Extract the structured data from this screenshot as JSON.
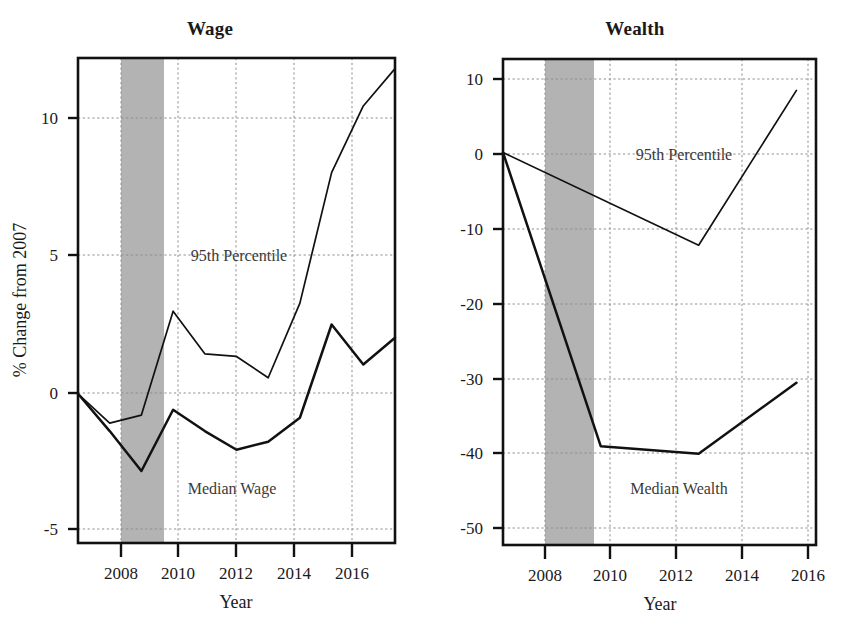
{
  "figure": {
    "background": "#ffffff",
    "ink_color": "#111111",
    "recession_band_color": "#a8a8a8",
    "gridline_color": "#8d8d8d"
  },
  "panels": [
    {
      "key": "wage",
      "title": "Wage",
      "xlabel": "Year",
      "ylabel": "% Change from 2007",
      "yticks": [
        "10",
        "5",
        "0",
        "-5"
      ],
      "xticks": [
        "2008",
        "2010",
        "2012",
        "2014",
        "2016"
      ],
      "annotations": [
        {
          "name": "p95-label",
          "text": "95th Percentile"
        },
        {
          "name": "median-label",
          "text": "Median Wage"
        }
      ]
    },
    {
      "key": "wealth",
      "title": "Wealth",
      "xlabel": "Year",
      "ylabel": "",
      "yticks": [
        "10",
        "0",
        "-10",
        "-20",
        "-30",
        "-40",
        "-50"
      ],
      "xticks": [
        "2008",
        "2010",
        "2012",
        "2014",
        "2016"
      ],
      "annotations": [
        {
          "name": "p95-label",
          "text": "95th Percentile"
        },
        {
          "name": "median-label",
          "text": "Median Wealth"
        }
      ]
    }
  ],
  "chart_data": [
    {
      "type": "line",
      "title": "Wage",
      "xlabel": "Year",
      "ylabel": "% Change from 2007",
      "xlim": [
        2007,
        2017
      ],
      "ylim": [
        -5.6,
        12.6
      ],
      "yticks": [
        10,
        5,
        0,
        -5
      ],
      "xticks": [
        2008,
        2010,
        2012,
        2014,
        2016
      ],
      "grid": true,
      "legend": "inline-annotation",
      "shaded_region": {
        "label": "Recession",
        "x_start": 2008.0,
        "x_end": 2009.5,
        "color": "#a8a8a8"
      },
      "series": [
        {
          "name": "95th Percentile",
          "x": [
            2007,
            2008,
            2009,
            2010,
            2011,
            2012,
            2013,
            2014,
            2015,
            2016,
            2017
          ],
          "values": [
            0.0,
            -1.1,
            -0.8,
            3.1,
            1.5,
            1.4,
            0.6,
            3.4,
            8.3,
            10.8,
            12.2
          ]
        },
        {
          "name": "Median Wage",
          "x": [
            2007,
            2008,
            2009,
            2010,
            2011,
            2012,
            2013,
            2014,
            2015,
            2016,
            2017
          ],
          "values": [
            0.0,
            -1.4,
            -2.9,
            -0.6,
            -1.4,
            -2.1,
            -1.8,
            -0.9,
            2.6,
            1.1,
            2.1
          ]
        }
      ]
    },
    {
      "type": "line",
      "title": "Wealth",
      "xlabel": "Year",
      "ylabel": "% Change from 2007",
      "xlim": [
        2007,
        2016.6
      ],
      "ylim": [
        -52.5,
        12.5
      ],
      "yticks": [
        10,
        0,
        -10,
        -20,
        -30,
        -40,
        -50
      ],
      "xticks": [
        2008,
        2010,
        2012,
        2014,
        2016
      ],
      "grid": true,
      "legend": "inline-annotation",
      "shaded_region": {
        "label": "Recession",
        "x_start": 2008.0,
        "x_end": 2009.5,
        "color": "#a8a8a8"
      },
      "series": [
        {
          "name": "95th Percentile",
          "x": [
            2007,
            2013,
            2016
          ],
          "values": [
            0.0,
            -12.4,
            8.3
          ]
        },
        {
          "name": "Median Wealth",
          "x": [
            2007,
            2010,
            2013,
            2016
          ],
          "values": [
            0.0,
            -39.3,
            -40.3,
            -30.8
          ]
        }
      ]
    }
  ]
}
